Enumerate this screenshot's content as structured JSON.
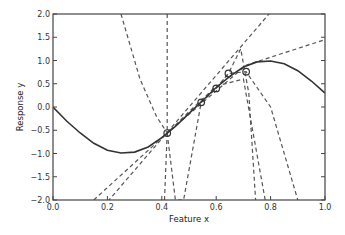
{
  "chart_data": {
    "type": "line",
    "title": "",
    "xlabel": "Feature x",
    "ylabel": "Response y",
    "xlim": [
      0.0,
      1.0
    ],
    "ylim": [
      -2.0,
      2.0
    ],
    "grid": false,
    "legend": null,
    "xticks": [
      "0.0",
      "0.2",
      "0.4",
      "0.6",
      "0.8",
      "1.0"
    ],
    "yticks": [
      "2.0",
      "1.5",
      "1.0",
      "0.5",
      "0.0",
      "-0.5",
      "-1.0",
      "-1.5",
      "-2.0"
    ],
    "true_function": {
      "name": "true curve",
      "style": "solid",
      "x": [
        0.0,
        0.05,
        0.1,
        0.15,
        0.2,
        0.25,
        0.3,
        0.35,
        0.4,
        0.45,
        0.5,
        0.55,
        0.6,
        0.65,
        0.7,
        0.75,
        0.8,
        0.85,
        0.9,
        0.95,
        1.0
      ],
      "y": [
        0.0,
        -0.3,
        -0.56,
        -0.78,
        -0.93,
        -0.99,
        -0.97,
        -0.86,
        -0.66,
        -0.42,
        -0.14,
        0.14,
        0.42,
        0.66,
        0.86,
        0.97,
        0.99,
        0.93,
        0.78,
        0.56,
        0.3
      ]
    },
    "samples": {
      "name": "training points",
      "marker": "circle",
      "x": [
        0.42,
        0.545,
        0.6,
        0.645,
        0.71
      ],
      "y": [
        -0.56,
        0.1,
        0.4,
        0.72,
        0.76
      ]
    },
    "fits": [
      {
        "name": "fit 1",
        "style": "dashed",
        "x": [
          0.0,
          0.5,
          1.0
        ],
        "y": [
          -3.4,
          0.0,
          3.4
        ]
      },
      {
        "name": "fit 2",
        "style": "dashed",
        "x": [
          0.15,
          0.42,
          0.71,
          1.0
        ],
        "y": [
          -2.0,
          -0.56,
          0.9,
          1.45
        ]
      },
      {
        "name": "fit 3",
        "style": "dashed",
        "x": [
          0.25,
          0.32,
          0.38,
          0.42,
          0.5,
          0.6,
          0.7,
          0.78
        ],
        "y": [
          2.0,
          0.6,
          -0.2,
          -0.56,
          -0.1,
          0.45,
          0.6,
          -2.0
        ]
      },
      {
        "name": "fit 4",
        "style": "dashed",
        "x": [
          0.42,
          0.42,
          0.45,
          0.48,
          0.545,
          0.6,
          0.645,
          0.69,
          0.72,
          0.745
        ],
        "y": [
          2.0,
          -0.56,
          -2.0,
          -2.0,
          0.1,
          0.4,
          0.72,
          1.25,
          0.3,
          -2.0
        ]
      },
      {
        "name": "fit 5",
        "style": "dashed",
        "x": [
          0.41,
          0.42,
          0.545,
          0.6,
          0.645,
          0.71,
          0.8,
          0.9
        ],
        "y": [
          -2.0,
          -0.56,
          0.1,
          0.4,
          0.72,
          0.76,
          0.0,
          -2.0
        ]
      }
    ]
  }
}
